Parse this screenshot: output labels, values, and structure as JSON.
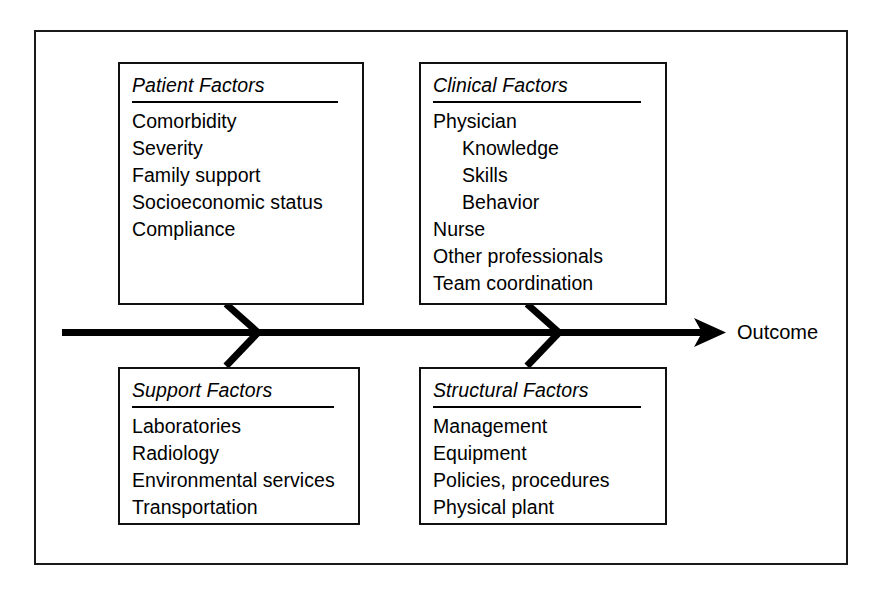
{
  "diagram": {
    "type": "fishbone-ishikawa",
    "outcome_label": "Outcome",
    "line_color": "#000000",
    "border_color": "#111111",
    "background_color": "#ffffff",
    "categories": [
      {
        "id": "patient",
        "title": "Patient Factors",
        "position": "top-left",
        "items": [
          {
            "text": "Comorbidity",
            "indent": 0
          },
          {
            "text": "Severity",
            "indent": 0
          },
          {
            "text": "Family support",
            "indent": 0
          },
          {
            "text": "Socioeconomic status",
            "indent": 0
          },
          {
            "text": "Compliance",
            "indent": 0
          }
        ]
      },
      {
        "id": "clinical",
        "title": "Clinical Factors",
        "position": "top-right",
        "items": [
          {
            "text": "Physician",
            "indent": 0
          },
          {
            "text": "Knowledge",
            "indent": 1
          },
          {
            "text": "Skills",
            "indent": 1
          },
          {
            "text": "Behavior",
            "indent": 1
          },
          {
            "text": "Nurse",
            "indent": 0
          },
          {
            "text": "Other professionals",
            "indent": 0
          },
          {
            "text": "Team coordination",
            "indent": 0
          }
        ]
      },
      {
        "id": "support",
        "title": "Support Factors",
        "position": "bottom-left",
        "items": [
          {
            "text": "Laboratories",
            "indent": 0
          },
          {
            "text": "Radiology",
            "indent": 0
          },
          {
            "text": "Environmental services",
            "indent": 0
          },
          {
            "text": "Transportation",
            "indent": 0
          }
        ]
      },
      {
        "id": "structural",
        "title": "Structural Factors",
        "position": "bottom-right",
        "items": [
          {
            "text": "Management",
            "indent": 0
          },
          {
            "text": "Equipment",
            "indent": 0
          },
          {
            "text": "Policies, procedures",
            "indent": 0
          },
          {
            "text": "Physical plant",
            "indent": 0
          }
        ]
      }
    ]
  }
}
